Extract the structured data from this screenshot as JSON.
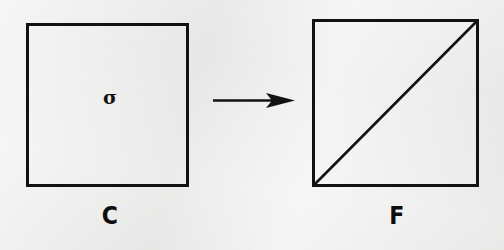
{
  "figure": {
    "type": "mathematical-transformation-diagram",
    "background_color": "#efefee",
    "ink_color": "#121212"
  },
  "left_shape": {
    "name": "square-c",
    "label": "C",
    "inner_symbol": "σ",
    "inner_symbol_name": "sigma",
    "stroke_color": "#121212",
    "fill": "none",
    "x": 26,
    "y": 23,
    "width": 162,
    "height": 163
  },
  "arrow": {
    "name": "transformation-arrow",
    "direction": "right",
    "x_start": 213,
    "x_end": 295,
    "y": 100,
    "color": "#121212"
  },
  "right_shape": {
    "name": "square-f",
    "label": "F",
    "stroke_color": "#121212",
    "fill": "none",
    "x": 312,
    "y": 19,
    "width": 166,
    "height": 167,
    "diagonal": {
      "name": "diagonal-line",
      "from": "bottom-left",
      "to": "top-right"
    }
  }
}
